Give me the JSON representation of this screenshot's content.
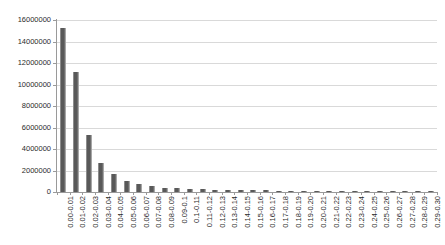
{
  "chart_data": {
    "type": "bar",
    "title": "",
    "subtitle": "",
    "xlabel": "",
    "ylabel": "",
    "grid": "horizontal",
    "legend": "none",
    "ylim": [
      0,
      16000000
    ],
    "ytick_step": 2000000,
    "ytick_labels": [
      "0",
      "2000000",
      "4000000",
      "6000000",
      "8000000",
      "10000000",
      "12000000",
      "14000000",
      "16000000"
    ],
    "ytick_values": [
      0,
      2000000,
      4000000,
      6000000,
      8000000,
      10000000,
      12000000,
      14000000,
      16000000
    ],
    "categories": [
      "0.00-0.01",
      "0.01-0.02",
      "0.02-0.03",
      "0.03-0.04",
      "0.04-0.05",
      "0.05-0.06",
      "0.06-0.07",
      "0.07-0.08",
      "0.08-0.09",
      "0.09-0.1",
      "0.1-0.11",
      "0.11-0.12",
      "0.12-0.13",
      "0.13-0.14",
      "0.14-0.15",
      "0.15-0.16",
      "0.16-0.17",
      "0.17-0.18",
      "0.18-0.19",
      "0.19-0.20",
      "0.20-0.21",
      "0.21-0.22",
      "0.22-0.23",
      "0.23-0.24",
      "0.24-0.25",
      "0.25-0.26",
      "0.26-0.27",
      "0.27-0.28",
      "0.28-0.29",
      "0.29-0.30"
    ],
    "values": [
      15300000,
      11150000,
      5300000,
      2700000,
      1700000,
      1050000,
      700000,
      520000,
      400000,
      330000,
      280000,
      250000,
      220000,
      200000,
      180000,
      160000,
      150000,
      140000,
      130000,
      120000,
      115000,
      110000,
      105000,
      100000,
      95000,
      90000,
      85000,
      80000,
      78000,
      75000
    ],
    "series_name": "Count",
    "bar_color": "#595959",
    "gridline_color": "#d9d9d9",
    "axis_color": "#9a9a9a",
    "plot_background": "#ffffff"
  }
}
